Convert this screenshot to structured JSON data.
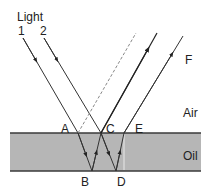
{
  "labels": {
    "light": "Light",
    "ray1": "1",
    "ray2": "2",
    "F": "F",
    "air": "Air",
    "oil": "Oil",
    "A": "A",
    "B": "B",
    "C": "C",
    "D": "D",
    "E": "E"
  },
  "colors": {
    "oil_fill": "#b6b6b6",
    "oil_border": "#3a3a3a",
    "ray": "#333333",
    "dashed_ray": "#888888",
    "background": "#ffffff"
  }
}
